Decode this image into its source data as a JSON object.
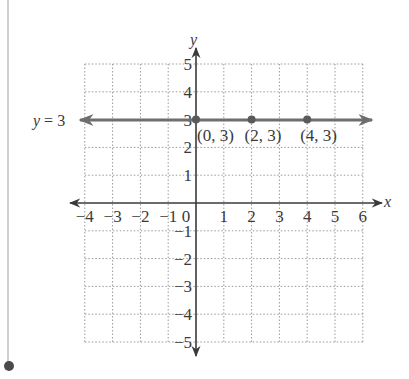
{
  "chart_data": {
    "type": "line",
    "title": "",
    "xlabel": "x",
    "ylabel": "y",
    "xlim": [
      -4,
      6
    ],
    "ylim": [
      -5,
      5
    ],
    "grid": true,
    "grid_style": "dotted",
    "x_ticks": [
      "-4",
      "-3",
      "-2",
      "-1",
      "0",
      "1",
      "2",
      "3",
      "4",
      "5",
      "6"
    ],
    "y_ticks": [
      "-5",
      "-4",
      "-3",
      "-2",
      "-1",
      "1",
      "2",
      "3",
      "4",
      "5"
    ],
    "series": [
      {
        "name": "y = 3",
        "equation": "y = 3",
        "type": "horizontal line",
        "x": [
          -4,
          6
        ],
        "y": [
          3,
          3
        ],
        "arrows": "both"
      }
    ],
    "points": [
      {
        "x": 0,
        "y": 3,
        "label": "(0, 3)"
      },
      {
        "x": 2,
        "y": 3,
        "label": "(2, 3)"
      },
      {
        "x": 4,
        "y": 3,
        "label": "(4, 3)"
      }
    ],
    "annotations": [
      {
        "text": "y = 3",
        "position": "left of line"
      }
    ]
  },
  "labels": {
    "x_axis": "x",
    "y_axis": "y",
    "line_label": "y = 3",
    "origin": "0",
    "point_labels": [
      "(0, 3)",
      "(2, 3)",
      "(4, 3)"
    ]
  },
  "colors": {
    "axis": "#3a3a3a",
    "line": "#6e6e6e",
    "point": "#5a5a5a",
    "grid": "#9a9a9a",
    "side_rule": "#c8c8c8",
    "side_dot": "#4a4a4a"
  }
}
